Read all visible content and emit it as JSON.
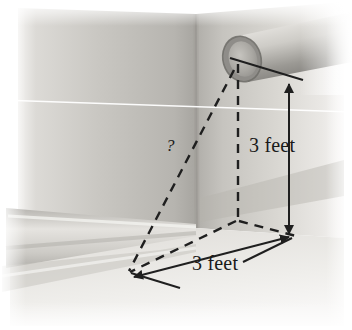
{
  "figure": {
    "labels": {
      "height_dimension": "3 feet",
      "width_dimension": "3 feet",
      "unknown_length": "?"
    },
    "annotations": {
      "vertical_dimension_value": "3 feet",
      "horizontal_dimension_value": "3 feet",
      "diagonal_query": "?"
    },
    "colors": {
      "wall_light": "#d8d6d1",
      "wall_mid": "#c2c0bb",
      "wall_shadow": "#a9a7a2",
      "floor_light": "#eceae6",
      "floor_mid": "#dcdad5",
      "pipe_light": "#d5d3ce",
      "pipe_dark": "#8f8d89",
      "pipe_bore": "#b9b7b2",
      "line_ink": "#1f1f1f",
      "scanline": "#ffffff",
      "page_background": "#ffffff"
    },
    "elements": {
      "pipe": "pipe-cylinder",
      "pipe_opening": "pipe-opening-ellipse",
      "wall_corner": "wall-corner-edge",
      "baseboard": "baseboard-molding",
      "dashed_vertical": "dashed-vertical-drop-line",
      "dashed_diagonal": "dashed-space-diagonal",
      "dashed_floor_left": "dashed-floor-line-left",
      "dashed_floor_right": "dashed-floor-line-right",
      "height_arrow": "vertical-dimension-arrow",
      "width_arrow": "horizontal-dimension-arrow",
      "leader_line": "pipe-center-leader-line",
      "scan_artifact": "horizontal-scan-artifact"
    }
  }
}
